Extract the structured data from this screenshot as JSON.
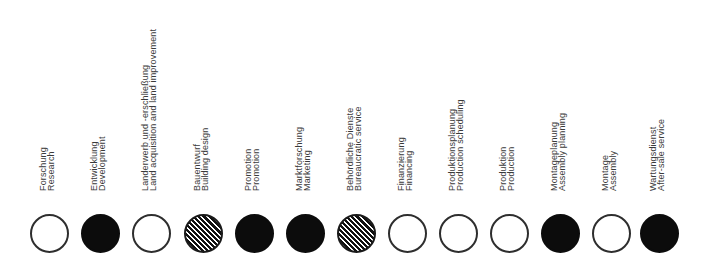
{
  "diagram": {
    "legend_styles": {
      "open": "white circle with dark outline",
      "filled": "solid black circle",
      "hatched": "diagonally hatched circle"
    },
    "colors": {
      "ink": "#0c0c0c",
      "outline": "#2e2e2e",
      "text": "#3a3a3a",
      "background": "#ffffff"
    },
    "items": [
      {
        "german": "Forschung",
        "english": "Research",
        "marker": "open",
        "x": 30
      },
      {
        "german": "Entwicklung",
        "english": "Development",
        "marker": "filled",
        "x": 81
      },
      {
        "german": "Landerwerb und -erschließung",
        "english": "Land acquisition and land improvement",
        "marker": "open",
        "x": 132
      },
      {
        "german": "Bauentwurf",
        "english": "Building design",
        "marker": "hatched",
        "x": 184
      },
      {
        "german": "Promotion",
        "english": "Promotion",
        "marker": "filled",
        "x": 235
      },
      {
        "german": "Marktforschung",
        "english": "Marketing",
        "marker": "filled",
        "x": 286
      },
      {
        "german": "Behördliche Dienste",
        "english": "Bureaucratic service",
        "marker": "hatched",
        "x": 337
      },
      {
        "german": "Finanzierung",
        "english": "Financing",
        "marker": "open",
        "x": 388
      },
      {
        "german": "Produktionsplanung",
        "english": "Production scheduling",
        "marker": "open",
        "x": 439
      },
      {
        "german": "Produktion",
        "english": "Production",
        "marker": "open",
        "x": 490
      },
      {
        "german": "Montageplanung",
        "english": "Assembly planning",
        "marker": "filled",
        "x": 541
      },
      {
        "german": "Montage",
        "english": "Assembly",
        "marker": "open",
        "x": 592
      },
      {
        "german": "Wartungsdienst",
        "english": "After-sale service",
        "marker": "filled",
        "x": 640
      }
    ]
  }
}
